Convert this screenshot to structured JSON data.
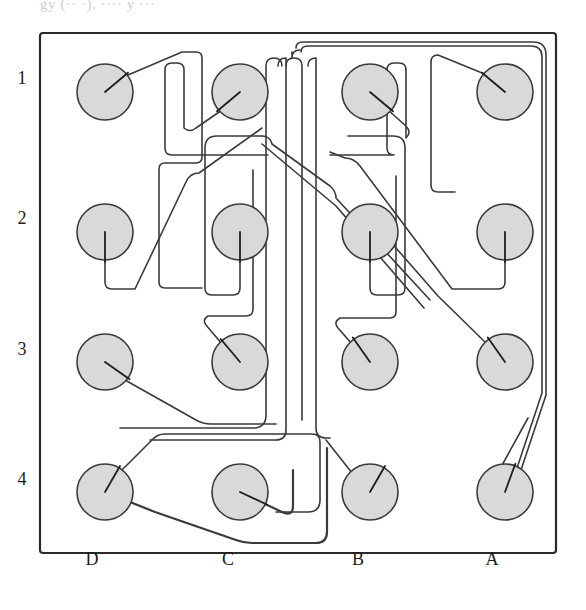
{
  "figure": {
    "title_fragment": "gy (·· ·), ···· y ···",
    "type": "pcb-routing-diagram",
    "board": {
      "x": 40,
      "y": 33,
      "width": 516,
      "height": 520,
      "corner_radius": 3,
      "stroke": "#2b2b2b",
      "fill": "#ffffff"
    },
    "colors": {
      "pad_fill": "#d9d9d9",
      "pad_stroke": "#3a3a3a",
      "trace": "#3a3a3a",
      "stub": "#1e1e1e",
      "label": "#1c1c1c",
      "background": "#ffffff"
    },
    "row_labels": [
      {
        "label": "1",
        "x": 22,
        "y": 84
      },
      {
        "label": "2",
        "x": 22,
        "y": 224
      },
      {
        "label": "3",
        "x": 22,
        "y": 355
      },
      {
        "label": "4",
        "x": 22,
        "y": 485
      }
    ],
    "column_labels": [
      {
        "label": "D",
        "x": 92,
        "y": 565
      },
      {
        "label": "C",
        "x": 228,
        "y": 565
      },
      {
        "label": "B",
        "x": 358,
        "y": 565
      },
      {
        "label": "A",
        "x": 492,
        "y": 565
      }
    ],
    "grid": {
      "columns": [
        "D",
        "C",
        "B",
        "A"
      ],
      "rows": [
        "1",
        "2",
        "3",
        "4"
      ],
      "column_x": [
        105,
        240,
        370,
        505
      ],
      "row_y": [
        92,
        232,
        362,
        492
      ],
      "pad_radius": 28
    },
    "pads": [
      {
        "id": "D1",
        "col": "D",
        "row": "1",
        "cx": 105,
        "cy": 92,
        "r": 28,
        "stub_angle_deg": -40
      },
      {
        "id": "C1",
        "col": "C",
        "row": "1",
        "cx": 240,
        "cy": 92,
        "r": 28,
        "stub_angle_deg": 140
      },
      {
        "id": "B1",
        "col": "B",
        "row": "1",
        "cx": 370,
        "cy": 92,
        "r": 28,
        "stub_angle_deg": 40
      },
      {
        "id": "A1",
        "col": "A",
        "row": "1",
        "cx": 505,
        "cy": 92,
        "r": 28,
        "stub_angle_deg": -140
      },
      {
        "id": "D2",
        "col": "D",
        "row": "2",
        "cx": 105,
        "cy": 232,
        "r": 28,
        "stub_angle_deg": 90
      },
      {
        "id": "C2",
        "col": "C",
        "row": "2",
        "cx": 240,
        "cy": 232,
        "r": 28,
        "stub_angle_deg": 90
      },
      {
        "id": "B2",
        "col": "B",
        "row": "2",
        "cx": 370,
        "cy": 232,
        "r": 28,
        "stub_angle_deg": 90
      },
      {
        "id": "A2",
        "col": "A",
        "row": "2",
        "cx": 505,
        "cy": 232,
        "r": 28,
        "stub_angle_deg": 90
      },
      {
        "id": "D3",
        "col": "D",
        "row": "3",
        "cx": 105,
        "cy": 362,
        "r": 28,
        "stub_angle_deg": 35
      },
      {
        "id": "C3",
        "col": "C",
        "row": "3",
        "cx": 240,
        "cy": 362,
        "r": 28,
        "stub_angle_deg": -130
      },
      {
        "id": "B3",
        "col": "B",
        "row": "3",
        "cx": 370,
        "cy": 362,
        "r": 28,
        "stub_angle_deg": -125
      },
      {
        "id": "A3",
        "col": "A",
        "row": "3",
        "cx": 505,
        "cy": 362,
        "r": 28,
        "stub_angle_deg": -125
      },
      {
        "id": "D4",
        "col": "D",
        "row": "4",
        "cx": 105,
        "cy": 492,
        "r": 28,
        "stub_angle_deg": -60
      },
      {
        "id": "C4",
        "col": "C",
        "row": "4",
        "cx": 240,
        "cy": 492,
        "r": 28,
        "stub_angle_deg": 25
      },
      {
        "id": "B4",
        "col": "B",
        "row": "4",
        "cx": 370,
        "cy": 492,
        "r": 28,
        "stub_angle_deg": -60
      },
      {
        "id": "A4",
        "col": "A",
        "row": "4",
        "cx": 505,
        "cy": 492,
        "r": 28,
        "stub_angle_deg": -70
      }
    ],
    "stub_length": 30,
    "traces": [
      {
        "id": "t-D1",
        "from": "D1",
        "width": 1.6,
        "d": "M 128 75 L 182 52 L 196 52 Q 202 52 202 58 L 202 157 Q 202 163 196 163 L 165 163 Q 159 163 159 169 L 159 282 Q 159 288 165 288 L 202 288"
      },
      {
        "id": "t-C1",
        "from": "C1",
        "width": 1.6,
        "d": "M 222 110 L 196 128 Q 190 133 184 128 L 184 70 Q 184 63 177 63 L 172 63 Q 165 63 165 70 L 165 148 Q 165 155 172 155 L 268 155"
      },
      {
        "id": "t-B1",
        "from": "B1",
        "width": 1.6,
        "d": "M 388 110 L 406 126 Q 412 132 406 138 L 406 70 Q 406 63 399 63 L 394 63 Q 387 63 387 70 L 387 148 Q 387 155 394 155 L 330 155"
      },
      {
        "id": "t-A1",
        "from": "A1",
        "width": 1.6,
        "d": "M 487 75 L 438 55 Q 431 55 431 62 L 431 185 Q 431 192 438 192 L 455 192"
      },
      {
        "id": "t-bus-outer-right",
        "from": "bus",
        "width": 1.6,
        "d": "M 296 48 Q 296 42 303 42 L 533 42 Q 546 42 546 55 L 546 395 L 521 470"
      },
      {
        "id": "t-bus-inner-right",
        "from": "bus",
        "width": 1.6,
        "d": "M 301 52 Q 301 46 308 46 L 531 46 Q 542 46 542 57 L 542 393 L 517 468"
      },
      {
        "id": "t-bus-v1",
        "from": "bus",
        "width": 1.6,
        "d": "M 292 52 L 292 58 Q 292 50 300 50"
      },
      {
        "id": "t-bus-col-a",
        "from": "bus",
        "width": 1.6,
        "d": "M 286 66 Q 286 58 294 58 Q 302 58 302 66 L 302 420"
      },
      {
        "id": "t-bus-col-b",
        "from": "bus",
        "width": 1.6,
        "d": "M 278 66 Q 278 58 286 58 L 286 430 Q 286 440 276 440 L 150 440"
      },
      {
        "id": "t-bus-col-c",
        "from": "bus",
        "width": 1.6,
        "d": "M 308 66 Q 308 58 316 58 L 316 428 Q 316 438 326 438 L 330 438"
      },
      {
        "id": "t-bus-left-1",
        "from": "bus",
        "width": 1.6,
        "d": "M 282 66 Q 282 58 274 58 Q 266 58 266 66 L 266 415 Q 266 428 253 428 L 120 428"
      },
      {
        "id": "t-C2",
        "from": "C2",
        "width": 1.6,
        "d": "M 240 262 L 240 288 Q 240 295 233 295 L 212 295 Q 205 295 205 288 L 205 148 Q 205 136 217 136 L 262 136"
      },
      {
        "id": "t-D2",
        "from": "D2",
        "width": 1.6,
        "d": "M 105 262 L 105 282 Q 105 289 112 289 L 135 289 L 186 182 Q 190 173 199 173 L 262 128"
      },
      {
        "id": "t-B2",
        "from": "B2",
        "width": 1.6,
        "d": "M 370 262 L 370 288 Q 370 295 377 295 L 398 295 Q 405 295 405 288 L 405 148 Q 405 136 393 136 L 348 136"
      },
      {
        "id": "t-A2",
        "from": "A2",
        "width": 1.6,
        "d": "M 505 262 L 505 282 Q 505 289 498 289 L 452 289 L 360 166 Q 354 158 345 158 L 330 152"
      },
      {
        "id": "t-diag-1",
        "from": "bundle",
        "width": 1.6,
        "d": "M 262 136 Q 270 136 272 144 L 330 186 Q 336 191 336 198 L 430 300"
      },
      {
        "id": "t-diag-2",
        "from": "bundle",
        "width": 1.6,
        "d": "M 262 144 L 336 206 L 424 308"
      },
      {
        "id": "t-D3",
        "from": "D3",
        "width": 1.6,
        "d": "M 125 380 L 196 420 Q 203 424 211 424 L 276 424"
      },
      {
        "id": "t-C3",
        "from": "C3",
        "width": 1.6,
        "d": "M 222 344 L 206 325 Q 202 320 208 316 L 246 316 Q 253 316 253 309 L 253 170"
      },
      {
        "id": "t-B3",
        "from": "B3",
        "width": 1.6,
        "d": "M 352 344 L 338 328 Q 333 322 340 318 L 390 318 Q 396 318 396 312 L 396 176"
      },
      {
        "id": "t-A3",
        "from": "A3",
        "width": 1.6,
        "d": "M 487 344 L 438 296 L 368 216"
      },
      {
        "id": "t-D4",
        "from": "D4",
        "width": 1.6,
        "d": "M 120 472 L 152 440 Q 157 434 165 434 L 312 434 Q 320 434 320 442 L 320 500 Q 320 512 308 512 L 276 512"
      },
      {
        "id": "t-D4b",
        "from": "D4",
        "width": 2.2,
        "d": "M 105 492 L 155 512 L 236 540 Q 244 543 252 543 L 316 543 Q 327 543 327 532 L 327 448"
      },
      {
        "id": "t-C4",
        "from": "C4",
        "width": 2.2,
        "d": "M 240 492 L 282 512 Q 293 517 293 506 L 293 470"
      },
      {
        "id": "t-B4",
        "from": "B4",
        "width": 1.6,
        "d": "M 356 478 L 326 440"
      },
      {
        "id": "t-A4",
        "from": "A4",
        "width": 1.6,
        "d": "M 495 478 L 528 418"
      }
    ]
  }
}
